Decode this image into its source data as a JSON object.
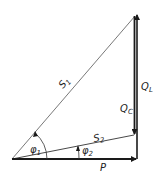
{
  "diagram": {
    "type": "power-triangle",
    "labels": {
      "s1": "S",
      "s1_sub": "1",
      "s2": "S",
      "s2_sub": "2",
      "ql": "Q",
      "ql_sub": "L",
      "qc": "Q",
      "qc_sub": "C",
      "p": "P",
      "phi1": "φ",
      "phi1_sub": "1",
      "phi2": "φ",
      "phi2_sub": "2"
    },
    "colors": {
      "line": "#1a1a1a",
      "background": "#ffffff"
    }
  }
}
